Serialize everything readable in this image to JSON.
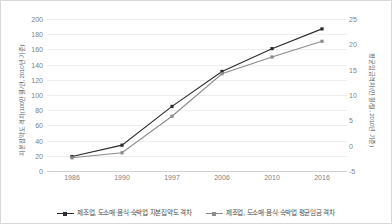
{
  "chart_data": {
    "type": "line",
    "title": "",
    "xlabel": "",
    "categories": [
      "1986",
      "1990",
      "1997",
      "2006",
      "2010",
      "2016"
    ],
    "grid": true,
    "legend_position": "bottom",
    "axes": {
      "left": {
        "label": "자본집약도 격차(100만 원/인, 2010년 기준)",
        "ticks": [
          200,
          180,
          160,
          140,
          120,
          100,
          80,
          60,
          40,
          20,
          0
        ],
        "lim": [
          0,
          200
        ]
      },
      "right": {
        "label": "평균임금격차(만 원/월, 2010년 기준)",
        "ticks": [
          25,
          20,
          15,
          10,
          5,
          0,
          -5
        ],
        "lim": [
          -5,
          25
        ]
      }
    },
    "series": [
      {
        "name": "제조업, 도소매·음식·숙박업 자본집약도 격차",
        "axis": "left",
        "color": "#2b2b2b",
        "marker": "square",
        "values": [
          19,
          34,
          85,
          131,
          161,
          187
        ]
      },
      {
        "name": "제조업, 도소매·음식·숙박업 평균임금 격차",
        "axis": "right",
        "color": "#8c8c8c",
        "marker": "square",
        "values": [
          -2.4,
          -1.4,
          5.8,
          14.2,
          17.5,
          20.6
        ]
      }
    ]
  },
  "colors": {
    "series_dark": "#2b2b2b",
    "series_gray": "#8c8c8c",
    "gridline": "#ededed",
    "border": "#d9d9d9",
    "tick_text": "#808080"
  }
}
